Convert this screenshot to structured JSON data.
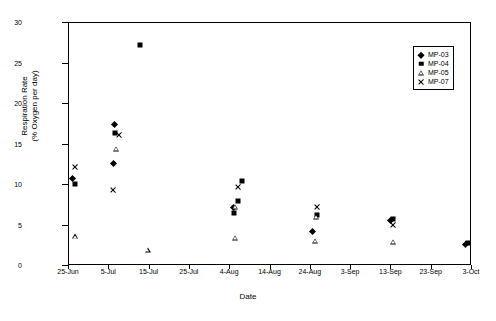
{
  "chart_data": {
    "type": "scatter",
    "title": "",
    "xlabel": "Date",
    "ylabel": "Respiration Rate\n(% Oxygen per day)",
    "ylabel_line1": "Respiration Rate",
    "ylabel_line2": "(% Oxygen per day)",
    "ylim": [
      0,
      30
    ],
    "yticks": [
      0,
      5,
      10,
      15,
      20,
      25,
      30
    ],
    "xticks": [
      "25-Jun",
      "5-Jul",
      "15-Jul",
      "25-Jul",
      "4-Aug",
      "14-Aug",
      "24-Aug",
      "3-Sep",
      "13-Sep",
      "23-Sep",
      "3-Oct"
    ],
    "xtick_days": [
      0,
      10,
      20,
      30,
      40,
      50,
      60,
      70,
      80,
      90,
      100
    ],
    "xlim_days": [
      0,
      100
    ],
    "grid": false,
    "legend_position": "top-right",
    "marker_color": "#000000",
    "series": [
      {
        "name": "MP-03",
        "marker": "diamond",
        "points": [
          {
            "x": 1.5,
            "y": 10.5
          },
          {
            "x": 12.0,
            "y": 17.1
          },
          {
            "x": 11.6,
            "y": 12.4
          },
          {
            "x": 41.5,
            "y": 6.9
          },
          {
            "x": 61.0,
            "y": 4.0
          },
          {
            "x": 80.5,
            "y": 5.3
          },
          {
            "x": 99.0,
            "y": 2.4
          }
        ]
      },
      {
        "name": "MP-04",
        "marker": "square",
        "points": [
          {
            "x": 1.5,
            "y": 10.1
          },
          {
            "x": 11.3,
            "y": 16.4
          },
          {
            "x": 17.5,
            "y": 27.3
          },
          {
            "x": 43.0,
            "y": 10.5
          },
          {
            "x": 42.0,
            "y": 8.0
          },
          {
            "x": 41.0,
            "y": 6.6
          },
          {
            "x": 61.5,
            "y": 6.3
          },
          {
            "x": 80.5,
            "y": 5.8
          },
          {
            "x": 99.0,
            "y": 2.9
          }
        ]
      },
      {
        "name": "MP-05",
        "marker": "triangle",
        "points": [
          {
            "x": 1.5,
            "y": 3.7
          },
          {
            "x": 11.6,
            "y": 14.5
          },
          {
            "x": 19.5,
            "y": 2.0
          },
          {
            "x": 41.2,
            "y": 7.3
          },
          {
            "x": 41.2,
            "y": 3.5
          },
          {
            "x": 61.2,
            "y": 6.1
          },
          {
            "x": 61.0,
            "y": 3.1
          },
          {
            "x": 80.3,
            "y": 3.0
          }
        ]
      },
      {
        "name": "MP-07",
        "marker": "cross",
        "points": [
          {
            "x": 1.5,
            "y": 12.2
          },
          {
            "x": 12.5,
            "y": 16.2
          },
          {
            "x": 11.0,
            "y": 9.4
          },
          {
            "x": 42.0,
            "y": 9.7
          },
          {
            "x": 61.5,
            "y": 7.3
          },
          {
            "x": 80.5,
            "y": 5.1
          }
        ]
      }
    ]
  },
  "legend": {
    "items": [
      {
        "label": "MP-03",
        "marker": "diamond"
      },
      {
        "label": "MP-04",
        "marker": "square"
      },
      {
        "label": "MP-05",
        "marker": "triangle"
      },
      {
        "label": "MP-07",
        "marker": "cross"
      }
    ]
  }
}
